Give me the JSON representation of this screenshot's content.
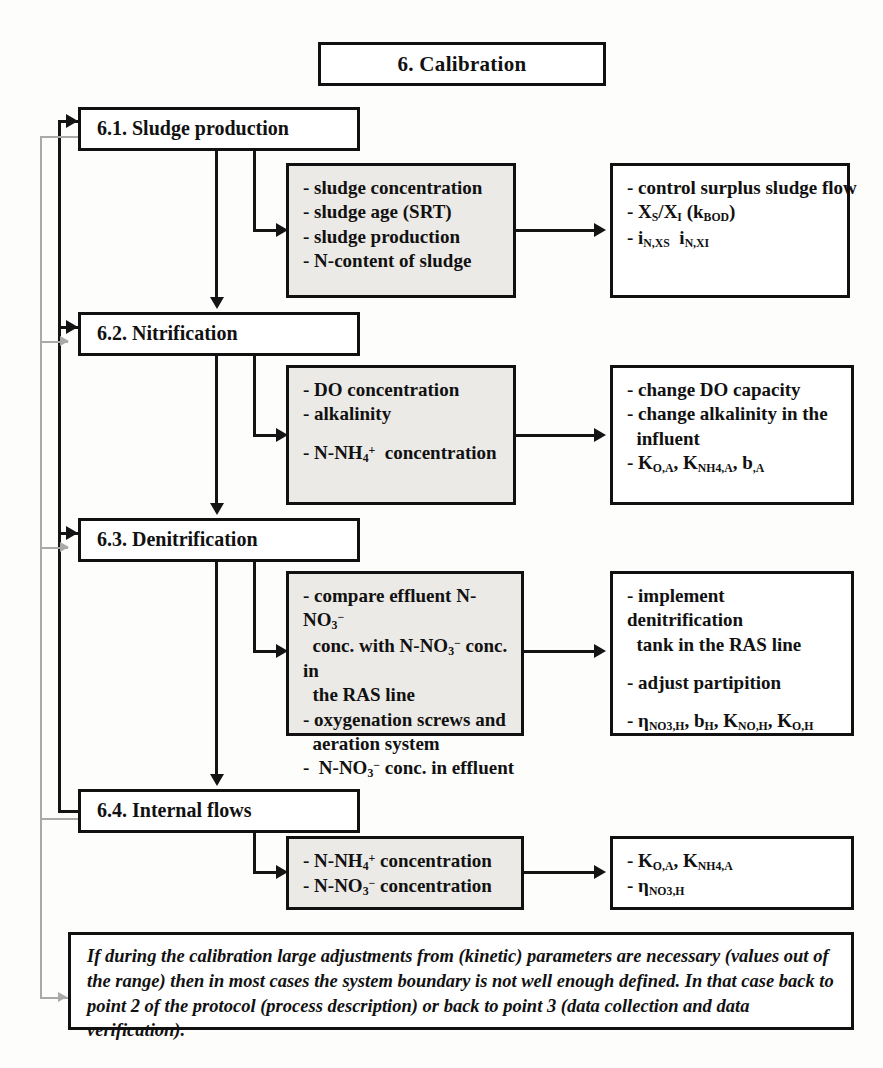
{
  "diagram": {
    "title": "6. Calibration",
    "sections": [
      {
        "id": "6.1",
        "heading": "6.1. Sludge production",
        "middle": [
          "- sludge concentration",
          "- sludge age (SRT)",
          "- sludge production",
          "- N-content of sludge"
        ],
        "right": [
          "- control surplus sludge flow",
          "- X_S/X_I (k_BOD)",
          "- i_N,XS   i_N,XI"
        ]
      },
      {
        "id": "6.2",
        "heading": "6.2. Nitrification",
        "middle": [
          "- DO concentration",
          "- alkalinity",
          "- N-NH4+ concentration"
        ],
        "right": [
          "- change DO capacity",
          "- change alkalinity in the influent",
          "- K_O,A, K_NH4,A, b_,A"
        ]
      },
      {
        "id": "6.3",
        "heading": "6.3. Denitrification",
        "middle": [
          "- compare effluent N-NO3- conc. with N-NO3- conc. in the RAS line",
          "- oxygenation screws and aeration system",
          "- N-NO3- conc. in effluent"
        ],
        "right": [
          "- implement denitrification tank in the RAS line",
          "- adjust partipition",
          "- eta_NO3,H, b_H, K_NO,H, K_O,H"
        ]
      },
      {
        "id": "6.4",
        "heading": "6.4. Internal flows",
        "middle": [
          "- N-NH4+ concentration",
          "- N-NO3- concentration"
        ],
        "right": [
          "- K_O,A, K_NH4,A",
          "- eta_NO3,H"
        ]
      }
    ],
    "note": "If during the calibration large adjustments from (kinetic) parameters are necessary (values out of the range) then in most cases the system boundary is not well enough defined. In that case back to point 2 of the protocol (process description) or back to point 3 (data collection and data verification)."
  }
}
